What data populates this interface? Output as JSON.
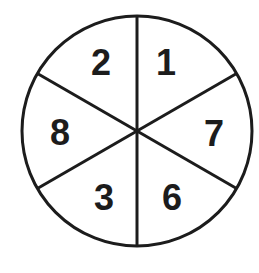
{
  "diagram": {
    "type": "spinner",
    "center": {
      "x": 137,
      "y": 131
    },
    "radius": 115,
    "stroke_color": "#1c1c1c",
    "fill_color": "#ffffff",
    "section_count": 6,
    "sections": [
      {
        "position": "top-right",
        "label": "1"
      },
      {
        "position": "right",
        "label": "7"
      },
      {
        "position": "bottom-right",
        "label": "6"
      },
      {
        "position": "bottom-left",
        "label": "3"
      },
      {
        "position": "left",
        "label": "8"
      },
      {
        "position": "top-left",
        "label": "2"
      }
    ]
  }
}
